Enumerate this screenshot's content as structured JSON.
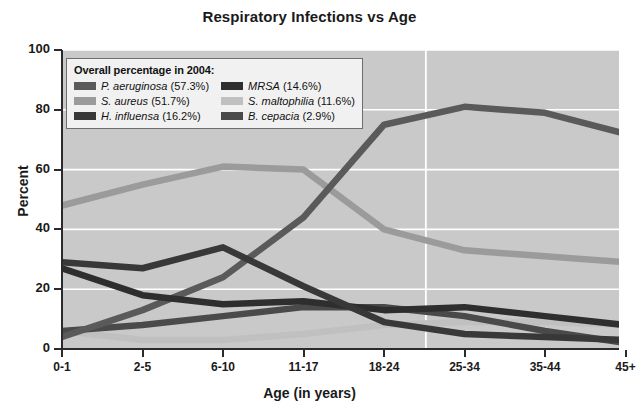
{
  "chart_data": {
    "type": "line",
    "title": "Respiratory Infections vs Age",
    "xlabel": "Age (in years)",
    "ylabel": "Percent",
    "ylim": [
      0,
      100
    ],
    "yticks": [
      0,
      20,
      40,
      60,
      80,
      100
    ],
    "grid": "horizontal-white-gridlines-plus-one-vertical",
    "legend_position": "upper-left-inside",
    "legend_title": "Overall percentage in 2004:",
    "categories": [
      "0-1",
      "2-5",
      "6-10",
      "11-17",
      "18-24",
      "25-34",
      "35-44",
      "45+"
    ],
    "series": [
      {
        "name": "P. aeruginosa",
        "overall_label": "P. aeruginosa (57.3%)",
        "overall_percent": 57.3,
        "color": "#5a5a5a",
        "values": [
          4,
          13,
          24,
          44,
          75,
          81,
          79,
          72
        ]
      },
      {
        "name": "S. aureus",
        "overall_label": "S. aureus (51.7%)",
        "overall_percent": 51.7,
        "color": "#9b9b9b",
        "values": [
          48,
          55,
          61,
          60,
          40,
          33,
          31,
          29
        ]
      },
      {
        "name": "H. influensa",
        "overall_label": "H. influensa (16.2%)",
        "overall_percent": 16.2,
        "color": "#383838",
        "values": [
          29,
          27,
          34,
          21,
          9,
          5,
          4,
          3
        ]
      },
      {
        "name": "MRSA",
        "overall_label": "MRSA (14.6%)",
        "overall_percent": 14.6,
        "color": "#2e2e2e",
        "values": [
          27,
          18,
          15,
          16,
          13,
          14,
          11,
          8
        ]
      },
      {
        "name": "S. maltophilia",
        "overall_label": "S. maltophilia (11.6%)",
        "overall_percent": 11.6,
        "color": "#c0c0c0",
        "values": [
          6,
          3,
          3,
          5,
          8,
          9,
          9,
          8
        ]
      },
      {
        "name": "B. cepacia",
        "overall_label": "B. cepacia (2.9%)",
        "overall_percent": 2.9,
        "color": "#4a4a4a",
        "values": [
          6,
          8,
          11,
          14,
          14,
          11,
          6,
          2
        ]
      }
    ]
  },
  "axes": {
    "y_tick_labels": [
      "100",
      "80",
      "60",
      "40",
      "20",
      "0"
    ],
    "x_tick_labels": [
      "0-1",
      "2-5",
      "6-10",
      "11-17",
      "18-24",
      "25-34",
      "35-44",
      "45+"
    ],
    "y_title": "Percent",
    "x_title": "Age (in years)"
  },
  "legend": {
    "title": "Overall percentage in 2004:",
    "left_column": [
      {
        "label": "P. aeruginosa (57.3%)",
        "genus": "P. aeruginosa",
        "pct": "(57.3%)",
        "color": "#5a5a5a"
      },
      {
        "label": "S. aureus (51.7%)",
        "genus": "S. aureus",
        "pct": "(51.7%)",
        "color": "#9b9b9b"
      },
      {
        "label": "H. influensa (16.2%)",
        "genus": "H. influensa",
        "pct": "(16.2%)",
        "color": "#383838"
      }
    ],
    "right_column": [
      {
        "label": "MRSA (14.6%)",
        "genus": "MRSA",
        "pct": "(14.6%)",
        "color": "#2e2e2e"
      },
      {
        "label": "S. maltophilia (11.6%)",
        "genus": "S. maltophilia",
        "pct": "(11.6%)",
        "color": "#c0c0c0"
      },
      {
        "label": "B. cepacia (2.9%)",
        "genus": "B. cepacia",
        "pct": "(2.9%)",
        "color": "#4a4a4a"
      }
    ]
  },
  "colors": {
    "plot_background": "#c9c9c9",
    "gridline": "#ffffff",
    "axis": "#2b2b2b",
    "text": "#1a1a1a",
    "legend_background": "#f1f1f1",
    "legend_border": "#6e6e6e"
  }
}
